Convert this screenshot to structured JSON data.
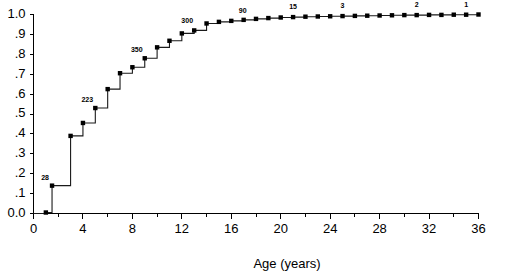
{
  "chart_data": {
    "type": "line",
    "title": "",
    "subtitle": "",
    "xlabel": "Age (years)",
    "ylabel": "",
    "xlim": [
      0,
      36
    ],
    "ylim": [
      0,
      1.0
    ],
    "grid": false,
    "legend_position": "none",
    "step_style": "post",
    "xticks": [
      0,
      4,
      8,
      12,
      16,
      20,
      24,
      28,
      32,
      36
    ],
    "xtick_labels": [
      "0",
      "4",
      "8",
      "12",
      "16",
      "20",
      "24",
      "28",
      "32",
      "36"
    ],
    "xminor_ticks": [
      2,
      6,
      10,
      14,
      18,
      22,
      26,
      30,
      34
    ],
    "yticks": [
      0.0,
      0.1,
      0.2,
      0.3,
      0.4,
      0.5,
      0.6,
      0.7,
      0.8,
      0.9,
      1.0
    ],
    "ytick_labels": [
      "0.0",
      ".1",
      ".2",
      ".3",
      ".4",
      ".5",
      ".6",
      ".7",
      ".8",
      ".9",
      "1.0"
    ],
    "series": [
      {
        "name": "Cumulative proportion",
        "marker": "square",
        "color": "#000000",
        "x": [
          0,
          1,
          1.5,
          3,
          4,
          5,
          6,
          7,
          8,
          9,
          10,
          11,
          12,
          13,
          14,
          15,
          16,
          17,
          18,
          19,
          20,
          21,
          22,
          23,
          24,
          25,
          26,
          27,
          28,
          29,
          30,
          31,
          32,
          33,
          34,
          35,
          36
        ],
        "y": [
          0.0,
          0.005,
          0.14,
          0.39,
          0.455,
          0.53,
          0.625,
          0.705,
          0.735,
          0.78,
          0.835,
          0.868,
          0.905,
          0.92,
          0.955,
          0.963,
          0.968,
          0.973,
          0.978,
          0.982,
          0.985,
          0.987,
          0.989,
          0.99,
          0.991,
          0.992,
          0.993,
          0.994,
          0.995,
          0.996,
          0.997,
          0.997,
          0.998,
          0.998,
          0.999,
          0.999,
          1.0
        ]
      }
    ],
    "annotations": [
      {
        "label": "28",
        "x": 1.5,
        "y": 0.14,
        "dx": -7,
        "dy": -6
      },
      {
        "label": "223",
        "x": 5.0,
        "y": 0.53,
        "dx": -8,
        "dy": -6
      },
      {
        "label": "350",
        "x": 9.0,
        "y": 0.78,
        "dx": -8,
        "dy": -6
      },
      {
        "label": "300",
        "x": 13.0,
        "y": 0.92,
        "dx": -7,
        "dy": -7
      },
      {
        "label": "90",
        "x": 17.0,
        "y": 0.973,
        "dx": -1,
        "dy": -7
      },
      {
        "label": "15",
        "x": 21.0,
        "y": 0.987,
        "dx": 0,
        "dy": -8
      },
      {
        "label": "3",
        "x": 25.0,
        "y": 0.992,
        "dx": 0,
        "dy": -8
      },
      {
        "label": "2",
        "x": 31.0,
        "y": 0.997,
        "dx": 0,
        "dy": -8
      },
      {
        "label": "1",
        "x": 35.0,
        "y": 0.999,
        "dx": 0,
        "dy": -8
      }
    ]
  },
  "axes": {
    "x_title": "Age (years)",
    "y_title": ""
  }
}
